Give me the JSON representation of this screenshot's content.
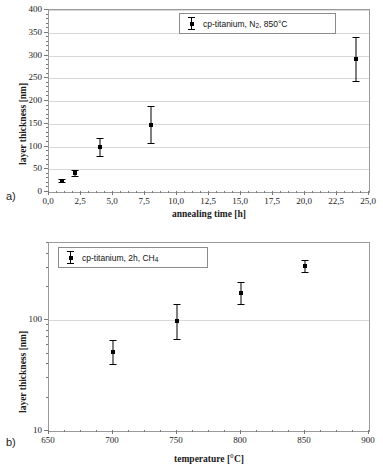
{
  "figure": {
    "panels": [
      {
        "label": "a)",
        "legend": "cp-titanium, N2, 850°C",
        "legend_parts": {
          "prefix": "cp-titanium, N",
          "sub": "2",
          "suffix": ", 850°C"
        }
      },
      {
        "label": "b)",
        "legend": "cp-titanium, 2h, CH4",
        "legend_parts": {
          "prefix": "cp-titanium, 2h, CH",
          "sub": "4",
          "suffix": ""
        }
      }
    ]
  },
  "chart_data": [
    {
      "type": "scatter",
      "panel": "a)",
      "title": "",
      "xlabel": "annealing time [h]",
      "ylabel": "layer thickness [nm]",
      "xlim": [
        0,
        25
      ],
      "ylim": [
        0,
        400
      ],
      "xscale": "linear",
      "yscale": "linear",
      "grid": true,
      "legend_position": "top-right",
      "xticks": [
        0,
        2.5,
        5,
        7.5,
        10,
        12.5,
        15,
        17.5,
        20,
        22.5,
        25
      ],
      "xticklabels": [
        "0,0",
        "2,5",
        "5,0",
        "7,5",
        "10,0",
        "12,5",
        "15,0",
        "17,5",
        "20,0",
        "22,5",
        "25,0"
      ],
      "yticks": [
        0,
        50,
        100,
        150,
        200,
        250,
        300,
        350,
        400
      ],
      "yticklabels": [
        "0",
        "50",
        "100",
        "150",
        "200",
        "250",
        "300",
        "350",
        "400"
      ],
      "series": [
        {
          "name": "cp-titanium, N2, 850°C",
          "x": [
            1,
            2,
            4,
            8,
            24
          ],
          "y": [
            25,
            42,
            99,
            148,
            293
          ],
          "yerr": [
            4,
            7,
            20,
            40,
            48
          ]
        }
      ]
    },
    {
      "type": "scatter",
      "panel": "b)",
      "title": "",
      "xlabel": "temperature [°C]",
      "ylabel": "layer thickness [nm]",
      "xlim": [
        650,
        900
      ],
      "ylim": [
        10,
        500
      ],
      "xscale": "linear",
      "yscale": "log",
      "grid": true,
      "legend_position": "top-left",
      "xticks": [
        650,
        700,
        750,
        800,
        850,
        900
      ],
      "xticklabels": [
        "650",
        "700",
        "750",
        "800",
        "850",
        "900"
      ],
      "yticks": [
        10,
        100
      ],
      "yticklabels": [
        "10",
        "100"
      ],
      "series": [
        {
          "name": "cp-titanium, 2h, CH4",
          "x": [
            700,
            750,
            800,
            850
          ],
          "y": [
            52,
            98,
            175,
            310
          ],
          "yerr_low": [
            12,
            30,
            35,
            35
          ],
          "yerr_high": [
            15,
            42,
            45,
            40
          ]
        }
      ]
    }
  ]
}
